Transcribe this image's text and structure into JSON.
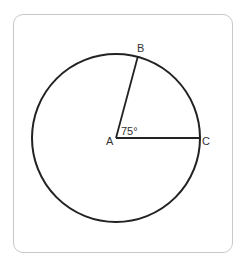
{
  "diagram": {
    "type": "circle with central angle",
    "points": {
      "A": {
        "label": "A",
        "role": "center"
      },
      "B": {
        "label": "B",
        "role": "point on circle"
      },
      "C": {
        "label": "C",
        "role": "point on circle"
      }
    },
    "angle_label": "75°",
    "angle_degrees": 75,
    "segments": [
      "AB",
      "AC"
    ],
    "colors": {
      "stroke": "#222222",
      "frame": "#c8c8c8",
      "text": "#333333"
    }
  }
}
